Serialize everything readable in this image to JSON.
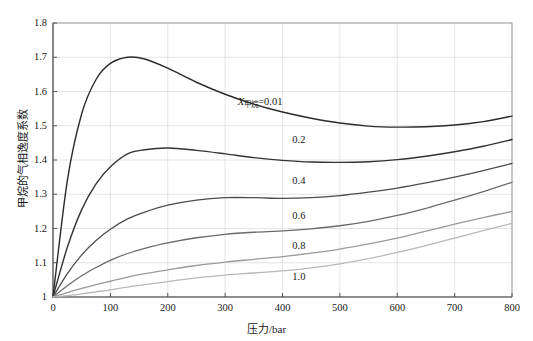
{
  "chart_data": {
    "type": "line",
    "title": "",
    "xlabel": "压力/bar",
    "ylabel": "甲烷的气相逸度系数",
    "xlim": [
      0,
      800
    ],
    "ylim": [
      1.0,
      1.8
    ],
    "xticks": [
      0,
      100,
      200,
      300,
      400,
      500,
      600,
      700,
      800
    ],
    "xtick_labels": [
      "0",
      "100",
      "200",
      "300",
      "400",
      "500",
      "600",
      "700",
      "800"
    ],
    "yticks": [
      1.0,
      1.1,
      1.2,
      1.3,
      1.4,
      1.5,
      1.6,
      1.7,
      1.8
    ],
    "ytick_labels": [
      "1",
      "1.1",
      "1.2",
      "1.3",
      "1.4",
      "1.5",
      "1.6",
      "1.7",
      "1.8"
    ],
    "grid": true,
    "legend": "inline-curve-labels",
    "x": [
      0,
      25,
      50,
      75,
      100,
      130,
      160,
      200,
      250,
      300,
      350,
      400,
      450,
      500,
      550,
      600,
      650,
      700,
      750,
      800
    ],
    "series": [
      {
        "name": "0.01",
        "label_text": "=0.01",
        "label_prefix_var": "X",
        "label_prefix_sub": "甲烷",
        "color": "#2b2b2b",
        "width": 1.4,
        "values": [
          1.0,
          1.34,
          1.535,
          1.635,
          1.682,
          1.7,
          1.695,
          1.668,
          1.627,
          1.592,
          1.563,
          1.54,
          1.522,
          1.508,
          1.499,
          1.496,
          1.497,
          1.502,
          1.512,
          1.528
        ]
      },
      {
        "name": "0.2",
        "label_text": "0.2",
        "color": "#333333",
        "width": 1.4,
        "values": [
          1.0,
          1.145,
          1.255,
          1.33,
          1.38,
          1.418,
          1.43,
          1.435,
          1.428,
          1.418,
          1.407,
          1.399,
          1.394,
          1.393,
          1.395,
          1.401,
          1.411,
          1.424,
          1.44,
          1.46
        ]
      },
      {
        "name": "0.4",
        "label_text": "0.4",
        "color": "#4d4d4d",
        "width": 1.3,
        "values": [
          1.0,
          1.068,
          1.123,
          1.165,
          1.198,
          1.228,
          1.248,
          1.268,
          1.283,
          1.29,
          1.29,
          1.288,
          1.29,
          1.296,
          1.306,
          1.318,
          1.333,
          1.35,
          1.369,
          1.39
        ]
      },
      {
        "name": "0.6",
        "label_text": "0.6",
        "color": "#6b6b6b",
        "width": 1.3,
        "values": [
          1.0,
          1.033,
          1.062,
          1.086,
          1.107,
          1.127,
          1.142,
          1.158,
          1.173,
          1.183,
          1.189,
          1.193,
          1.199,
          1.208,
          1.221,
          1.238,
          1.259,
          1.283,
          1.308,
          1.335
        ]
      },
      {
        "name": "0.8",
        "label_text": "0.8",
        "color": "#9a9a9a",
        "width": 1.3,
        "values": [
          1.0,
          1.013,
          1.025,
          1.036,
          1.046,
          1.058,
          1.068,
          1.079,
          1.092,
          1.102,
          1.11,
          1.118,
          1.128,
          1.14,
          1.155,
          1.172,
          1.192,
          1.213,
          1.232,
          1.25
        ]
      },
      {
        "name": "1.0",
        "label_text": "1.0",
        "color": "#b8b8b8",
        "width": 1.3,
        "values": [
          1.0,
          1.004,
          1.009,
          1.015,
          1.021,
          1.029,
          1.036,
          1.045,
          1.056,
          1.064,
          1.07,
          1.076,
          1.085,
          1.097,
          1.112,
          1.13,
          1.15,
          1.172,
          1.194,
          1.215
        ]
      }
    ],
    "annotations": [
      {
        "text": "=0.01",
        "var": "X",
        "sub": "甲烷",
        "x": 400,
        "y": 1.565
      },
      {
        "text": "0.2",
        "x": 440,
        "y": 1.455
      },
      {
        "text": "0.4",
        "x": 440,
        "y": 1.335
      },
      {
        "text": "0.6",
        "x": 440,
        "y": 1.235
      },
      {
        "text": "0.8",
        "x": 440,
        "y": 1.145
      },
      {
        "text": "1.0",
        "x": 440,
        "y": 1.055
      }
    ]
  },
  "axes": {
    "x_title": "压力/bar",
    "y_title": "甲烷的气相逸度系数"
  },
  "colors": {
    "grid": "#d9d9d9",
    "axis": "#555555",
    "background": "#ffffff",
    "text": "#1a1a1a"
  }
}
